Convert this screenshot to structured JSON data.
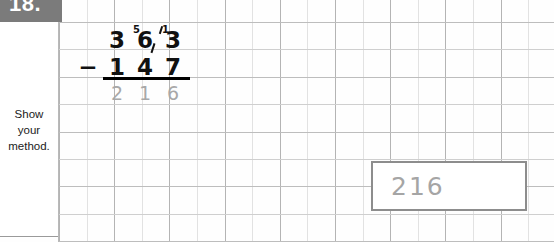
{
  "question": {
    "number_label": "18.",
    "instruction_lines": [
      "Show",
      "your",
      "method."
    ]
  },
  "calculation": {
    "minus_sign": "−",
    "minuend_digits": [
      "3",
      "6",
      "3"
    ],
    "subtrahend_digits": [
      "1",
      "4",
      "7"
    ],
    "answer_digits": [
      "2",
      "1",
      "6"
    ],
    "regroup_marks": [
      "5",
      "1"
    ]
  },
  "answer_box": {
    "value": "216"
  },
  "colors": {
    "tag_background": "#7b7b7b",
    "tag_text": "#ffffff",
    "ink": "#111111",
    "pencil": "#a8a8a8",
    "grid_light": "#e2e2e2",
    "grid_dark": "#b4b4b4",
    "box_border": "#8d8d8d"
  }
}
